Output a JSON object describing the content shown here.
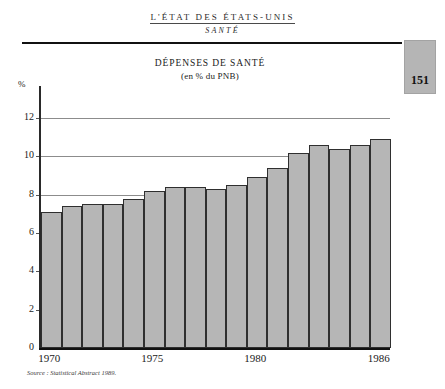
{
  "header": {
    "book_title": "L'ÉTAT DES ÉTATS-UNIS",
    "section_title": "SANTÉ",
    "page_number": "151"
  },
  "figure": {
    "title": "DÉPENSES DE SANTÉ",
    "subtitle": "(en % du PNB)",
    "source": "Source : Statistical Abstract 1989."
  },
  "colors": {
    "bar_fill": "#b6b6b6",
    "bar_border": "#2f2f2f",
    "gridline": "#8c8c8c",
    "page_tab": "#b5b5b5"
  },
  "chart_data": {
    "type": "bar",
    "title": "DÉPENSES DE SANTÉ",
    "subtitle": "(en % du PNB)",
    "xlabel": "",
    "ylabel": "%",
    "ylim": [
      0,
      13
    ],
    "ytick_values": [
      2,
      4,
      6,
      8,
      10,
      12
    ],
    "ytick_labels": [
      "2",
      "4",
      "6",
      "8",
      "10",
      "12"
    ],
    "gridline_values": [
      8,
      10,
      12
    ],
    "grid": true,
    "legend": "none",
    "categories": [
      1970,
      1971,
      1972,
      1973,
      1974,
      1975,
      1976,
      1977,
      1978,
      1979,
      1980,
      1981,
      1982,
      1983,
      1984,
      1985,
      1986
    ],
    "xtick_labels": [
      "1970",
      "1975",
      "1980",
      "1986"
    ],
    "xtick_categories": [
      1970,
      1975,
      1980,
      1986
    ],
    "values": [
      7.1,
      7.4,
      7.5,
      7.5,
      7.8,
      8.2,
      8.4,
      8.4,
      8.3,
      8.5,
      8.9,
      9.4,
      10.2,
      10.6,
      10.4,
      10.6,
      10.9
    ]
  }
}
